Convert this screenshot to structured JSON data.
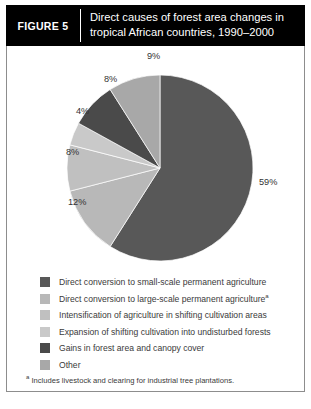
{
  "header": {
    "figure_tag": "FIGURE 5",
    "title_line1": "Direct causes of forest area changes in",
    "title_line2": "tropical African countries, 1990–2000"
  },
  "chart_data": {
    "type": "pie",
    "title": "Direct causes of forest area changes in tropical African countries, 1990–2000",
    "categories": [
      "Direct conversion to small-scale permanent agriculture",
      "Direct conversion to large-scale permanent agriculture",
      "Intensification of agriculture in shifting cultivation areas",
      "Expansion of shifting cultivation into undisturbed forests",
      "Gains in forest area and canopy cover",
      "Other"
    ],
    "values": [
      59,
      12,
      8,
      4,
      8,
      9
    ],
    "value_labels": [
      "59%",
      "12%",
      "8%",
      "4%",
      "8%",
      "9%"
    ],
    "colors": [
      "#585858",
      "#b8b8b8",
      "#c0c0c0",
      "#c9c9c9",
      "#4a4a4a",
      "#a8a8a8"
    ],
    "start_angle_deg": 0,
    "direction": "clockwise",
    "legend_position": "bottom",
    "grid": false,
    "units": "percent"
  },
  "legend": {
    "items": [
      {
        "label": "Direct conversion to small-scale permanent agriculture",
        "marker": "#585858",
        "footnote_mark": ""
      },
      {
        "label": "Direct conversion to large-scale permanent agriculture",
        "marker": "#b8b8b8",
        "footnote_mark": "a"
      },
      {
        "label": "Intensification of agriculture in shifting cultivation areas",
        "marker": "#c0c0c0",
        "footnote_mark": ""
      },
      {
        "label": "Expansion of shifting cultivation into undisturbed forests",
        "marker": "#c9c9c9",
        "footnote_mark": ""
      },
      {
        "label": "Gains in forest area and canopy cover",
        "marker": "#4a4a4a",
        "footnote_mark": ""
      },
      {
        "label": "Other",
        "marker": "#a8a8a8",
        "footnote_mark": ""
      }
    ]
  },
  "footnote": {
    "mark": "a",
    "text": "Includes livestock and clearing for industrial tree plantations."
  }
}
